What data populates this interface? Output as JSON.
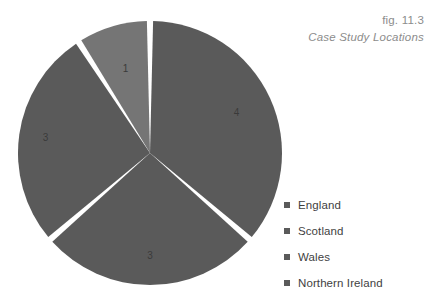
{
  "caption": {
    "number": "fig. 11.3",
    "title": "Case Study Locations"
  },
  "legend": {
    "items": [
      {
        "label": "England",
        "color": "#5a5a5a"
      },
      {
        "label": "Scotland",
        "color": "#5a5a5a"
      },
      {
        "label": "Wales",
        "color": "#5a5a5a"
      },
      {
        "label": "Northern Ireland",
        "color": "#5a5a5a"
      }
    ]
  },
  "chart_data": {
    "type": "pie",
    "title": "Case Study Locations",
    "figure_number": "fig. 11.3",
    "categories": [
      "England",
      "Scotland",
      "Wales",
      "Northern Ireland"
    ],
    "values": [
      4,
      3,
      3,
      1
    ],
    "total": 11,
    "data_labels": [
      "4",
      "3",
      "3",
      "1"
    ],
    "slice_colors": [
      "#5a5a5a",
      "#5a5a5a",
      "#5a5a5a",
      "#757575"
    ],
    "start_angle_deg": 0,
    "direction": "clockwise",
    "separator_color": "#ffffff",
    "legend_position": "right",
    "grid": false,
    "slices": [
      {
        "label": "England",
        "value": 4,
        "data_label": "4",
        "color": "#5a5a5a"
      },
      {
        "label": "Wales",
        "value": 3,
        "data_label": "3",
        "color": "#5a5a5a"
      },
      {
        "label": "Scotland",
        "value": 3,
        "data_label": "3",
        "color": "#5a5a5a"
      },
      {
        "label": "Northern Ireland",
        "value": 1,
        "data_label": "1",
        "color": "#757575"
      }
    ]
  }
}
